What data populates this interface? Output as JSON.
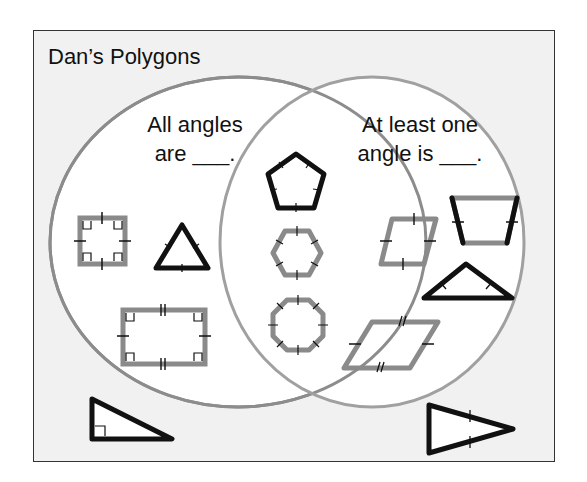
{
  "title": "Dan’s Polygons",
  "venn": {
    "left_label_line1": "All angles",
    "left_label_line2": "are ___.",
    "right_label_line1": "At least one",
    "right_label_line2": "angle is ___.",
    "circle_color": "#8c8c8c"
  },
  "regions": {
    "left_only": [
      "square",
      "equilateral-triangle",
      "rectangle"
    ],
    "intersection": [
      "regular-pentagon",
      "regular-hexagon",
      "regular-octagon"
    ],
    "right_only": [
      "rhombus",
      "isosceles-trapezoid",
      "obtuse-isosceles-triangle",
      "parallelogram"
    ],
    "outside": [
      "right-triangle",
      "acute-isosceles-triangle"
    ]
  },
  "colors": {
    "background": "#f1f1f1",
    "circle_fill": "#ffffff",
    "gray_shape": "#8a8a8a",
    "black_shape": "#111111"
  }
}
